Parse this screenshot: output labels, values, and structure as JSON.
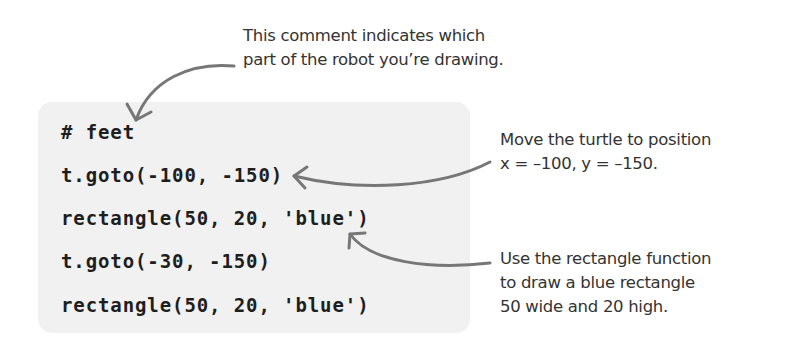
{
  "code": {
    "lines": [
      "# feet",
      "t.goto(-100, -150)",
      "rectangle(50, 20, 'blue')",
      "t.goto(-30, -150)",
      "rectangle(50, 20, 'blue')"
    ]
  },
  "annotations": {
    "comment_note": {
      "lines": [
        "This comment indicates which",
        "part of the robot you’re drawing."
      ]
    },
    "goto_note": {
      "lines": [
        "Move the turtle to position",
        "x = –100, y = –150."
      ]
    },
    "rectangle_note": {
      "lines": [
        "Use the rectangle function",
        "to draw a blue rectangle",
        "50 wide and 20 high."
      ]
    }
  },
  "colors": {
    "code_background": "#f1f1f1",
    "code_text": "#1e1e1e",
    "annotation_text": "#333333",
    "arrow": "#777777"
  }
}
